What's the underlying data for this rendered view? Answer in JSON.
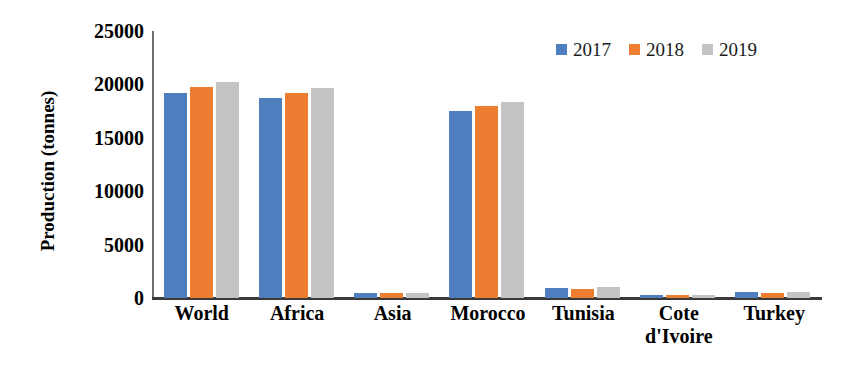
{
  "chart_data": {
    "type": "bar",
    "title": "",
    "xlabel": "",
    "ylabel": "Production (tonnes)",
    "ylim": [
      0,
      25000
    ],
    "yticks": [
      0,
      5000,
      10000,
      15000,
      20000,
      25000
    ],
    "ytick_labels": [
      "0",
      "5000",
      "10000",
      "15000",
      "20000",
      "25000"
    ],
    "grid": false,
    "legend_position": "top-right",
    "categories": [
      "World",
      "Africa",
      "Asia",
      "Morocco",
      "Tunisia",
      "Cote d'Ivoire",
      "Turkey"
    ],
    "category_lines": [
      [
        "World"
      ],
      [
        "Africa"
      ],
      [
        "Asia"
      ],
      [
        "Morocco"
      ],
      [
        "Tunisia"
      ],
      [
        "Cote",
        "d'Ivoire"
      ],
      [
        "Turkey"
      ]
    ],
    "series": [
      {
        "name": "2017",
        "color": "#4E7EBE",
        "values": [
          19200,
          18700,
          500,
          17500,
          900,
          300,
          550
        ]
      },
      {
        "name": "2018",
        "color": "#ED7D31",
        "values": [
          19750,
          19200,
          450,
          18000,
          850,
          280,
          450
        ]
      },
      {
        "name": "2019",
        "color": "#C3C3C3",
        "values": [
          20200,
          19700,
          500,
          18400,
          1000,
          300,
          550
        ]
      }
    ]
  },
  "legend": {
    "items": [
      {
        "label": "2017",
        "color": "#4E7EBE"
      },
      {
        "label": "2018",
        "color": "#ED7D31"
      },
      {
        "label": "2019",
        "color": "#C3C3C3"
      }
    ]
  },
  "axes": {
    "y_title": "Production (tonnes)"
  }
}
